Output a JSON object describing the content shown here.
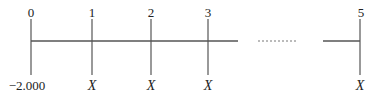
{
  "diagram": {
    "type": "cash-flow timeline",
    "periods": [
      {
        "period": "0",
        "x": 31,
        "cash_flow": "−2,000",
        "italic": false
      },
      {
        "period": "1",
        "x": 92,
        "cash_flow": "X",
        "italic": true
      },
      {
        "period": "2",
        "x": 151,
        "cash_flow": "X",
        "italic": true
      },
      {
        "period": "3",
        "x": 208,
        "cash_flow": "X",
        "italic": true
      },
      {
        "period": "5",
        "x": 360,
        "cash_flow": "X",
        "italic": true
      }
    ],
    "line_color": "#555555",
    "ellipsis": "dotted gap between period 3 and period 5"
  },
  "labels": {
    "p0": "0",
    "p1": "1",
    "p2": "2",
    "p3": "3",
    "p5": "5",
    "cf0": "−2.000",
    "cf1": "X",
    "cf2": "X",
    "cf3": "X",
    "cf5": "X"
  }
}
